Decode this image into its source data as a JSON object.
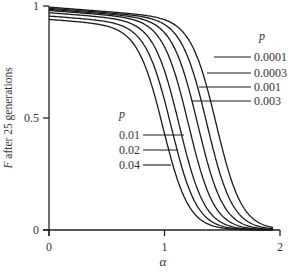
{
  "chart_data": {
    "type": "line",
    "title": "",
    "xlabel": "α",
    "ylabel": "F after 25 generations",
    "ylabel_italic_prefix": "F",
    "ylabel_rest": " after 25 generations",
    "xlim": [
      0,
      2
    ],
    "ylim": [
      0,
      1
    ],
    "x_ticks": [
      0,
      1,
      2
    ],
    "x_tick_labels": [
      "0",
      "1",
      "2"
    ],
    "y_ticks": [
      0,
      0.5,
      1
    ],
    "y_tick_labels": [
      "0",
      "0.5",
      "1"
    ],
    "grid": false,
    "legend_groups": [
      {
        "title": "p",
        "position": "right-upper",
        "entries": [
          "0.0001",
          "0.0003",
          "0.001",
          "0.003"
        ]
      },
      {
        "title": "p",
        "position": "center-left",
        "entries": [
          "0.01",
          "0.02",
          "0.04"
        ]
      }
    ],
    "series": [
      {
        "name": "p = 0.0001",
        "start_F": 0.995,
        "alpha_at_half": 1.45,
        "x": [
          0,
          0.5,
          1.0,
          1.2,
          1.3,
          1.4,
          1.45,
          1.5,
          1.6,
          1.7,
          1.8,
          1.9
        ],
        "values": [
          0.995,
          0.99,
          0.98,
          0.94,
          0.85,
          0.62,
          0.5,
          0.38,
          0.17,
          0.06,
          0.015,
          0.0
        ]
      },
      {
        "name": "p = 0.0003",
        "start_F": 0.99,
        "alpha_at_half": 1.37,
        "x": [
          0,
          0.5,
          1.0,
          1.2,
          1.3,
          1.37,
          1.45,
          1.5,
          1.6,
          1.7,
          1.8,
          1.9
        ],
        "values": [
          0.99,
          0.985,
          0.97,
          0.9,
          0.72,
          0.5,
          0.33,
          0.24,
          0.1,
          0.035,
          0.01,
          0.0
        ]
      },
      {
        "name": "p = 0.001",
        "start_F": 0.985,
        "alpha_at_half": 1.29,
        "x": [
          0,
          0.5,
          1.0,
          1.1,
          1.2,
          1.29,
          1.4,
          1.5,
          1.6,
          1.7,
          1.8,
          1.9
        ],
        "values": [
          0.985,
          0.975,
          0.95,
          0.88,
          0.72,
          0.5,
          0.28,
          0.14,
          0.05,
          0.015,
          0.005,
          0.0
        ]
      },
      {
        "name": "p = 0.003",
        "start_F": 0.98,
        "alpha_at_half": 1.21,
        "x": [
          0,
          0.5,
          1.0,
          1.1,
          1.21,
          1.3,
          1.4,
          1.5,
          1.6,
          1.7,
          1.8,
          1.9
        ],
        "values": [
          0.98,
          0.965,
          0.92,
          0.78,
          0.5,
          0.33,
          0.17,
          0.08,
          0.03,
          0.01,
          0.0,
          0.0
        ]
      },
      {
        "name": "p = 0.01",
        "start_F": 0.97,
        "alpha_at_half": 1.13,
        "x": [
          0,
          0.5,
          0.9,
          1.0,
          1.13,
          1.2,
          1.3,
          1.4,
          1.5,
          1.6,
          1.7,
          1.8
        ],
        "values": [
          0.97,
          0.95,
          0.88,
          0.78,
          0.5,
          0.38,
          0.22,
          0.11,
          0.05,
          0.02,
          0.005,
          0.0
        ]
      },
      {
        "name": "p = 0.02",
        "start_F": 0.955,
        "alpha_at_half": 1.06,
        "x": [
          0,
          0.5,
          0.9,
          1.0,
          1.06,
          1.2,
          1.3,
          1.4,
          1.5,
          1.6,
          1.7,
          1.8
        ],
        "values": [
          0.955,
          0.92,
          0.82,
          0.65,
          0.5,
          0.28,
          0.15,
          0.07,
          0.03,
          0.01,
          0.0,
          0.0
        ]
      },
      {
        "name": "p = 0.04",
        "start_F": 0.94,
        "alpha_at_half": 0.99,
        "x": [
          0,
          0.5,
          0.8,
          0.9,
          0.99,
          1.1,
          1.2,
          1.3,
          1.4,
          1.5,
          1.6,
          1.7
        ],
        "values": [
          0.94,
          0.89,
          0.8,
          0.68,
          0.5,
          0.33,
          0.2,
          0.1,
          0.04,
          0.015,
          0.005,
          0.0
        ]
      }
    ]
  }
}
